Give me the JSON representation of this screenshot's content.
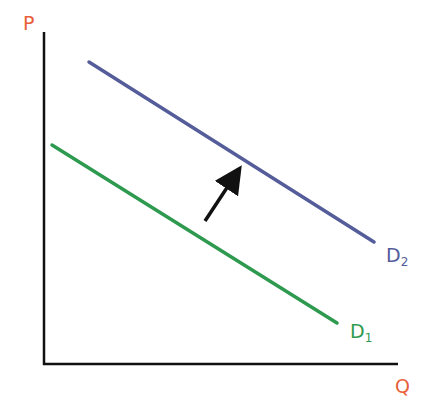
{
  "diagram": {
    "axes": {
      "y_label": "P",
      "x_label": "Q",
      "label_color": "#e8603c",
      "axis_color": "#111111"
    },
    "curves": [
      {
        "name": "D",
        "subscript": "1",
        "color": "#2e9a4f",
        "x1": 52,
        "y1": 145,
        "x2": 337,
        "y2": 323
      },
      {
        "name": "D",
        "subscript": "2",
        "color": "#545c9a",
        "x1": 89,
        "y1": 62,
        "x2": 374,
        "y2": 242
      }
    ],
    "arrow": {
      "from": [
        205,
        221
      ],
      "to": [
        236,
        174
      ],
      "color": "#111111",
      "meaning": "shift-right"
    }
  },
  "chart_data": {
    "type": "line",
    "title": "",
    "xlabel": "Q",
    "ylabel": "P",
    "series": [
      {
        "name": "D1",
        "x": [
          0,
          1
        ],
        "values": [
          0.7,
          0.12
        ]
      },
      {
        "name": "D2",
        "x": [
          0.13,
          1.1
        ],
        "values": [
          0.97,
          0.4
        ]
      }
    ],
    "annotations": [
      "arrow from D1 toward D2 indicating increase in demand"
    ]
  }
}
